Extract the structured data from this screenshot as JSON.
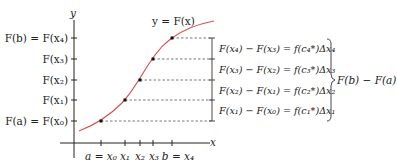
{
  "diagram": {
    "type": "mean-value-theorem-telescoping-sum",
    "curve_label": "y = F(x)",
    "axes": {
      "x_label": "x",
      "y_label": "y"
    },
    "y_ticks": [
      {
        "label": "F(b) = F(x₄)"
      },
      {
        "label": "F(x₃)"
      },
      {
        "label": "F(x₂)"
      },
      {
        "label": "F(x₁)"
      },
      {
        "label": "F(a) = F(x₀)"
      }
    ],
    "x_ticks": [
      {
        "label": "a = x₀"
      },
      {
        "label": "x₁"
      },
      {
        "label": "x₂"
      },
      {
        "label": "x₃"
      },
      {
        "label": "b = x₄"
      }
    ],
    "equations": [
      "F(x₄) − F(x₃) = f(c₄*)Δx₄",
      "F(x₃) − F(x₂) = f(c₃*)Δx₃",
      "F(x₂) − F(x₁) = f(c₂*)Δx₂",
      "F(x₁) − F(x₀) = f(c₁*)Δx₁"
    ],
    "brace_label": "F(b) − F(a)",
    "colors": {
      "curve": "#d9534f",
      "axis": "#222222",
      "dashed": "#555555"
    }
  }
}
